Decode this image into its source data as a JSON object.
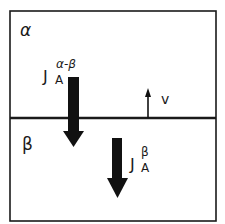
{
  "diagram": {
    "type": "two-phase interface flux schematic",
    "colors": {
      "line": "#1a1a1a",
      "background": "#ffffff"
    },
    "phases": {
      "top": {
        "label": "α"
      },
      "bottom": {
        "label": "β"
      }
    },
    "fluxes": [
      {
        "main": "J",
        "subscript": "A",
        "superscript": "α-β",
        "direction": "down",
        "crosses_interface": true
      },
      {
        "main": "J",
        "subscript": "A",
        "superscript": "β",
        "direction": "down",
        "crosses_interface": false
      }
    ],
    "interface_velocity": {
      "label": "v",
      "direction": "up"
    }
  }
}
